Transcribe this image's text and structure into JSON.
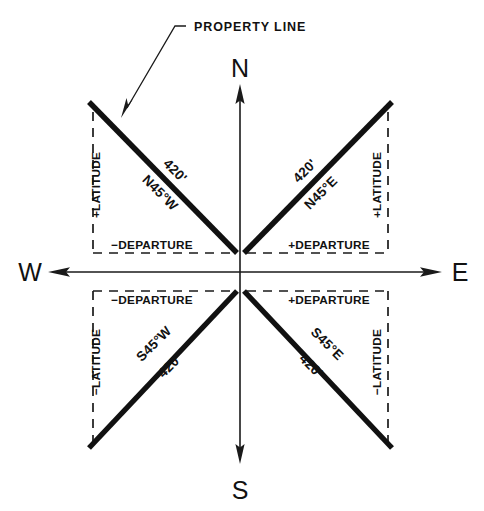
{
  "diagram": {
    "title_label": "PROPERTY LINE",
    "cardinals": {
      "north": "N",
      "south": "S",
      "east": "E",
      "west": "W"
    },
    "quadrants": [
      {
        "id": "northwest",
        "bearing": "N45°W",
        "distance": "420'",
        "latitude_label": "+LATITUDE",
        "departure_label": "−DEPARTURE"
      },
      {
        "id": "northeast",
        "bearing": "N45°E",
        "distance": "420'",
        "latitude_label": "+LATITUDE",
        "departure_label": "+DEPARTURE"
      },
      {
        "id": "southwest",
        "bearing": "S45°W",
        "distance": "420'",
        "latitude_label": "−LATITUDE",
        "departure_label": "−DEPARTURE"
      },
      {
        "id": "southeast",
        "bearing": "S45°E",
        "distance": "420'",
        "latitude_label": "−LATITUDE",
        "departure_label": "+DEPARTURE"
      }
    ],
    "colors": {
      "ink": "#111111",
      "background": "#ffffff"
    }
  }
}
